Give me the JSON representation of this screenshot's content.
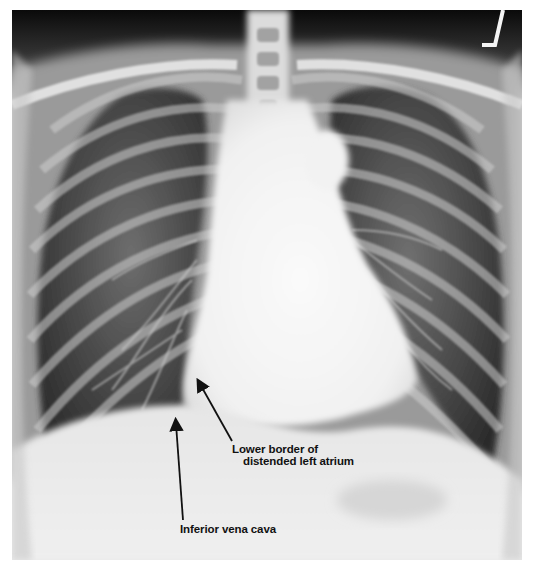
{
  "image": {
    "type": "chest-radiograph",
    "view": "frontal (PA)",
    "colors": {
      "background": "#ffffff",
      "film_base": "#e9e9e9",
      "lung_dark": "#3a3a3a",
      "bone_bright": "#f4f4f4",
      "annotation_text": "#111111"
    }
  },
  "annotations": [
    {
      "id": "atrium",
      "line1": "Lower border of",
      "line2": "distended left atrium"
    },
    {
      "id": "ivc",
      "text": "Inferior vena cava"
    }
  ]
}
